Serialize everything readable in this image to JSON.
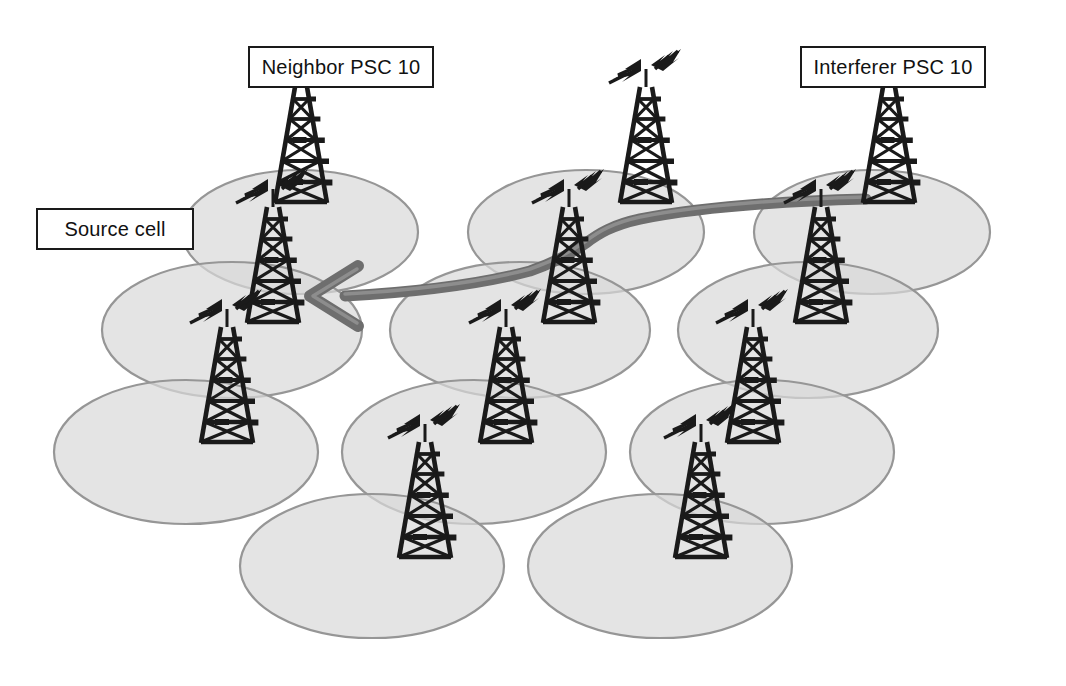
{
  "diagram": {
    "type": "cellular-network-coverage",
    "background_color": "#ffffff",
    "cell_fill_color": "#d9d9d9",
    "cell_stroke_color": "#969696",
    "tower_color": "#1a1a1a",
    "arrow_color": "#6e6e6e",
    "label_text_color": "#111111",
    "label_border_color": "#1a1a1a",
    "label_fill_color": "#ffffff"
  },
  "labels": [
    {
      "id": "neighbor",
      "text": "Neighbor PSC 10"
    },
    {
      "id": "interferer",
      "text": "Interferer PSC 10"
    },
    {
      "id": "source",
      "text": "Source cell"
    }
  ],
  "cells": [
    {
      "id": "cell-r1-c1",
      "cx": 300,
      "cy": 232,
      "rx": 118,
      "ry": 62,
      "row": 1,
      "col": 1
    },
    {
      "id": "cell-r1-c2",
      "cx": 586,
      "cy": 232,
      "rx": 118,
      "ry": 62,
      "row": 1,
      "col": 2
    },
    {
      "id": "cell-r1-c3",
      "cx": 872,
      "cy": 232,
      "rx": 118,
      "ry": 62,
      "row": 1,
      "col": 3
    },
    {
      "id": "cell-r2-c1",
      "cx": 232,
      "cy": 330,
      "rx": 130,
      "ry": 68,
      "row": 2,
      "col": 1
    },
    {
      "id": "cell-r2-c2",
      "cx": 520,
      "cy": 330,
      "rx": 130,
      "ry": 68,
      "row": 2,
      "col": 2
    },
    {
      "id": "cell-r2-c3",
      "cx": 808,
      "cy": 330,
      "rx": 130,
      "ry": 68,
      "row": 2,
      "col": 3
    },
    {
      "id": "cell-r3-c1",
      "cx": 186,
      "cy": 452,
      "rx": 132,
      "ry": 72,
      "row": 3,
      "col": 1
    },
    {
      "id": "cell-r3-c2",
      "cx": 474,
      "cy": 452,
      "rx": 132,
      "ry": 72,
      "row": 3,
      "col": 2
    },
    {
      "id": "cell-r3-c3",
      "cx": 762,
      "cy": 452,
      "rx": 132,
      "ry": 72,
      "row": 3,
      "col": 3
    },
    {
      "id": "cell-r4-c1",
      "cx": 372,
      "cy": 566,
      "rx": 132,
      "ry": 72,
      "row": 4,
      "col": 1
    },
    {
      "id": "cell-r4-c2",
      "cx": 660,
      "cy": 566,
      "rx": 132,
      "ry": 72,
      "row": 4,
      "col": 2
    }
  ],
  "towers": [
    {
      "id": "tower-neighbor",
      "x": 300,
      "y": 215,
      "scale": 1.0,
      "role": "neighbor-psc-10"
    },
    {
      "id": "tower-top-center",
      "x": 645,
      "y": 215,
      "scale": 1.0,
      "role": "cell"
    },
    {
      "id": "tower-interferer",
      "x": 888,
      "y": 215,
      "scale": 1.0,
      "role": "interferer-psc-10"
    },
    {
      "id": "tower-source",
      "x": 272,
      "y": 335,
      "scale": 1.0,
      "role": "source-cell"
    },
    {
      "id": "tower-mid-center",
      "x": 568,
      "y": 335,
      "scale": 1.0,
      "role": "cell"
    },
    {
      "id": "tower-mid-right",
      "x": 820,
      "y": 335,
      "scale": 1.0,
      "role": "cell"
    },
    {
      "id": "tower-low-left",
      "x": 226,
      "y": 455,
      "scale": 1.0,
      "role": "cell"
    },
    {
      "id": "tower-low-center",
      "x": 505,
      "y": 455,
      "scale": 1.0,
      "role": "cell"
    },
    {
      "id": "tower-low-right",
      "x": 752,
      "y": 455,
      "scale": 1.0,
      "role": "cell"
    },
    {
      "id": "tower-bottom-left",
      "x": 424,
      "y": 570,
      "scale": 1.0,
      "role": "cell"
    },
    {
      "id": "tower-bottom-right",
      "x": 700,
      "y": 570,
      "scale": 1.0,
      "role": "cell"
    }
  ],
  "arrow": {
    "id": "interference-arrow",
    "from_tower": "tower-interferer",
    "to_tower": "tower-source",
    "direction": "right-to-left",
    "description": "Curved arrow from interferer tower to source cell tower"
  }
}
